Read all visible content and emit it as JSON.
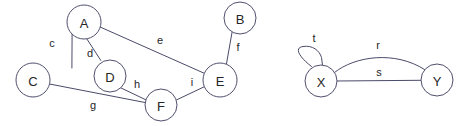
{
  "canvas": {
    "width": 470,
    "height": 126,
    "background": "#ffffff",
    "node_stroke": "#50506e",
    "edge_stroke": "#4a4a6a",
    "node_fill": "#ffffff",
    "text_color": "#262626"
  },
  "graphs": [
    {
      "id": "left-graph",
      "nodes": [
        {
          "id": "A",
          "label": "A",
          "cx": 84,
          "cy": 22,
          "r": 17
        },
        {
          "id": "B",
          "label": "B",
          "cx": 240,
          "cy": 18,
          "r": 16
        },
        {
          "id": "C",
          "label": "C",
          "cx": 33,
          "cy": 80,
          "r": 17
        },
        {
          "id": "D",
          "label": "D",
          "cx": 110,
          "cy": 76,
          "r": 16
        },
        {
          "id": "E",
          "label": "E",
          "cx": 220,
          "cy": 80,
          "r": 17
        },
        {
          "id": "F",
          "label": "F",
          "cx": 161,
          "cy": 105,
          "r": 16
        }
      ],
      "edges": [
        {
          "id": "c",
          "label": "c",
          "from": "A",
          "to": "C",
          "label_x": 52,
          "label_y": 43
        },
        {
          "id": "d",
          "label": "d",
          "from": "A",
          "to": "D",
          "label_x": 90,
          "label_y": 53
        },
        {
          "id": "e",
          "label": "e",
          "from": "A",
          "to": "E",
          "label_x": 160,
          "label_y": 40
        },
        {
          "id": "f",
          "label": "f",
          "from": "B",
          "to": "E",
          "label_x": 238,
          "label_y": 47
        },
        {
          "id": "g",
          "label": "g",
          "from": "C",
          "to": "F",
          "label_x": 93,
          "label_y": 105
        },
        {
          "id": "h",
          "label": "h",
          "from": "D",
          "to": "F",
          "label_x": 137,
          "label_y": 84
        },
        {
          "id": "i",
          "label": "i",
          "from": "F",
          "to": "E",
          "label_x": 192,
          "label_y": 82
        }
      ]
    },
    {
      "id": "right-graph",
      "nodes": [
        {
          "id": "X",
          "label": "X",
          "cx": 321,
          "cy": 81,
          "r": 16
        },
        {
          "id": "Y",
          "label": "Y",
          "cx": 437,
          "cy": 80,
          "r": 16
        }
      ],
      "edges": [
        {
          "id": "t",
          "label": "t",
          "from": "X",
          "to": "X",
          "kind": "self-loop",
          "label_x": 314,
          "label_y": 38
        },
        {
          "id": "r",
          "label": "r",
          "from": "X",
          "to": "Y",
          "kind": "curve",
          "label_x": 378,
          "label_y": 45
        },
        {
          "id": "s",
          "label": "s",
          "from": "X",
          "to": "Y",
          "kind": "straight",
          "label_x": 379,
          "label_y": 72
        }
      ]
    }
  ],
  "edge_paths": {
    "c": "M 71.9 68.0 L 72.1 33.8",
    "d": "M 86.8 38.8 L 100.8 60.4",
    "e": "M 100.1 27.0 L 204.1 73.2",
    "f": "M 232.1 32.0 L 226.4 64.2",
    "g": "M 49.5 84.0 L 145.0 102.5",
    "h": "M 120.7 87.8 L 147.5 100.6",
    "i": "M 176.8 99.8 L 205.0 86.4",
    "t": "M 311.5 66.5 C 300.5 58.0 293.0 48.0 303.0 46.5 C 312.5 45.0 319.5 50.5 321.5 57.5 L 322.5 65.2",
    "r": "M 334.5 72.5 C 355.0 56.0 395.0 50.5 424.5 69.5",
    "s": "M 337.0 81.0 L 421.0 80.3"
  }
}
